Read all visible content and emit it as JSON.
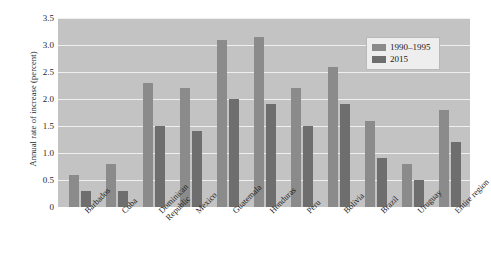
{
  "chart_data": {
    "type": "bar",
    "title": "",
    "xlabel": "",
    "ylabel": "Annual rate of increase (percent)",
    "ylim": [
      0,
      3.5
    ],
    "yticks": [
      "3.5",
      "3.0",
      "2.5",
      "2.0",
      "1.5",
      "1.0",
      "0.5",
      "0"
    ],
    "ytick_values": [
      3.5,
      3.0,
      2.5,
      2.0,
      1.5,
      1.0,
      0.5,
      0
    ],
    "grid": true,
    "legend_position": "top-right",
    "categories": [
      "Barbados",
      "Cuba",
      "Dominican Republic",
      "Mexico",
      "Guatemala",
      "Honduras",
      "Peru",
      "Bolivia",
      "Brazil",
      "Uruguay",
      "Entire region"
    ],
    "category_lines": [
      [
        "Barbados",
        ""
      ],
      [
        "Cuba",
        ""
      ],
      [
        "Dominican",
        "Republic"
      ],
      [
        "Mexico",
        ""
      ],
      [
        "Guatemala",
        ""
      ],
      [
        "Honduras",
        ""
      ],
      [
        "Peru",
        ""
      ],
      [
        "Bolivia",
        ""
      ],
      [
        "Brazil",
        ""
      ],
      [
        "Uruguay",
        ""
      ],
      [
        "Entire region",
        ""
      ]
    ],
    "series": [
      {
        "name": "1990–1995",
        "color": "#8b8b8b",
        "values": [
          0.6,
          0.8,
          2.3,
          2.2,
          3.1,
          3.15,
          2.2,
          2.6,
          1.6,
          0.8,
          1.8
        ]
      },
      {
        "name": "2015",
        "color": "#6e6e6e",
        "values": [
          0.3,
          0.3,
          1.5,
          1.4,
          2.0,
          1.9,
          1.5,
          1.9,
          0.9,
          0.5,
          1.2
        ]
      }
    ]
  },
  "legend": {
    "items": [
      {
        "label": "1990–1995"
      },
      {
        "label": "2015"
      }
    ]
  }
}
